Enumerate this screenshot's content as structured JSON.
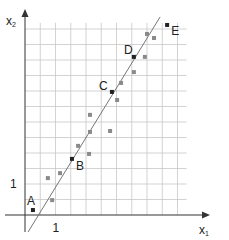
{
  "chart_data": {
    "type": "scatter",
    "title": "",
    "xlabel": "x",
    "xlabel_sub": "1",
    "ylabel": "x",
    "ylabel_sub": "2",
    "xlim": [
      0,
      6.5
    ],
    "ylim": [
      0,
      6.5
    ],
    "grid": true,
    "grid_step": 0.5,
    "x_ticks": [
      {
        "value": 1,
        "label": "1"
      }
    ],
    "y_ticks": [
      {
        "value": 1,
        "label": "1"
      }
    ],
    "colors": {
      "labeled_point": "#222222",
      "point": "#8a8a8a",
      "line": "#666666",
      "grid": "#c8c8c8",
      "axis": "#333333"
    },
    "fit_line": {
      "x": [
        0.1,
        4.43
      ],
      "y": [
        -0.55,
        6.39
      ]
    },
    "labeled_points": [
      {
        "label": "A",
        "x": 0.26,
        "y": 0.16
      },
      {
        "label": "B",
        "x": 1.54,
        "y": 1.81
      },
      {
        "label": "C",
        "x": 2.85,
        "y": 3.97
      },
      {
        "label": "D",
        "x": 3.57,
        "y": 5.1
      },
      {
        "label": "E",
        "x": 4.66,
        "y": 6.13
      }
    ],
    "points": [
      {
        "x": 0.89,
        "y": 0.48
      },
      {
        "x": 0.75,
        "y": 1.19
      },
      {
        "x": 1.15,
        "y": 1.35
      },
      {
        "x": 1.74,
        "y": 2.23
      },
      {
        "x": 2.1,
        "y": 1.97
      },
      {
        "x": 2.13,
        "y": 2.68
      },
      {
        "x": 2.13,
        "y": 3.23
      },
      {
        "x": 2.79,
        "y": 2.71
      },
      {
        "x": 3.02,
        "y": 3.71
      },
      {
        "x": 3.15,
        "y": 4.26
      },
      {
        "x": 3.57,
        "y": 4.61
      },
      {
        "x": 3.93,
        "y": 5.1
      },
      {
        "x": 4.0,
        "y": 5.84
      },
      {
        "x": 4.23,
        "y": 5.71
      }
    ]
  }
}
